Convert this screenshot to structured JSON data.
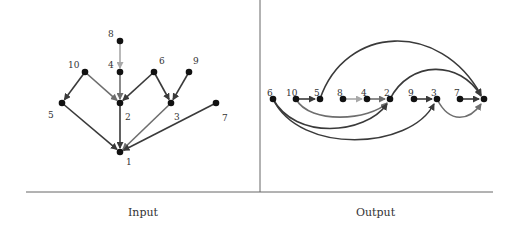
{
  "captions": {
    "left": "Input",
    "right": "Output"
  },
  "colors": {
    "dark": "#3a3a3a",
    "mid": "#6e6e6e",
    "light": "#a8a8a8",
    "node": "#111111",
    "rule": "#666666"
  },
  "input_graph": {
    "nodes": [
      {
        "id": "8",
        "x": 120,
        "y": 41,
        "lx": 108,
        "ly": 37
      },
      {
        "id": "4",
        "x": 120,
        "y": 72,
        "lx": 108,
        "ly": 68
      },
      {
        "id": "10",
        "x": 85,
        "y": 72,
        "lx": 68,
        "ly": 68
      },
      {
        "id": "6",
        "x": 154,
        "y": 72,
        "lx": 159,
        "ly": 64
      },
      {
        "id": "9",
        "x": 189,
        "y": 72,
        "lx": 193,
        "ly": 64
      },
      {
        "id": "5",
        "x": 62,
        "y": 103,
        "lx": 48,
        "ly": 118
      },
      {
        "id": "2",
        "x": 120,
        "y": 103,
        "lx": 125,
        "ly": 120
      },
      {
        "id": "3",
        "x": 171,
        "y": 103,
        "lx": 174,
        "ly": 120
      },
      {
        "id": "7",
        "x": 216,
        "y": 103,
        "lx": 222,
        "ly": 121
      },
      {
        "id": "1",
        "x": 120,
        "y": 152,
        "lx": 126,
        "ly": 165
      }
    ],
    "edges": [
      {
        "from": "8",
        "to": "4",
        "color": "light"
      },
      {
        "from": "4",
        "to": "2",
        "color": "mid"
      },
      {
        "from": "10",
        "to": "5",
        "color": "dark"
      },
      {
        "from": "10",
        "to": "2",
        "color": "mid"
      },
      {
        "from": "6",
        "to": "2",
        "color": "dark"
      },
      {
        "from": "6",
        "to": "3",
        "color": "dark"
      },
      {
        "from": "9",
        "to": "3",
        "color": "dark"
      },
      {
        "from": "5",
        "to": "1",
        "color": "dark"
      },
      {
        "from": "2",
        "to": "1",
        "color": "dark"
      },
      {
        "from": "3",
        "to": "1",
        "color": "mid"
      },
      {
        "from": "7",
        "to": "1",
        "color": "dark"
      }
    ]
  },
  "output_graph": {
    "order": [
      "6",
      "10",
      "5",
      "8",
      "4",
      "2",
      "9",
      "3",
      "7",
      "1"
    ],
    "nodes": [
      {
        "id": "6",
        "x": 273,
        "y": 99
      },
      {
        "id": "10",
        "x": 296,
        "y": 99
      },
      {
        "id": "5",
        "x": 320,
        "y": 99
      },
      {
        "id": "8",
        "x": 343,
        "y": 99
      },
      {
        "id": "4",
        "x": 367,
        "y": 99
      },
      {
        "id": "2",
        "x": 390,
        "y": 99
      },
      {
        "id": "9",
        "x": 414,
        "y": 99
      },
      {
        "id": "3",
        "x": 437,
        "y": 99
      },
      {
        "id": "7",
        "x": 460,
        "y": 99
      },
      {
        "id": "1",
        "x": 484,
        "y": 99
      }
    ]
  }
}
